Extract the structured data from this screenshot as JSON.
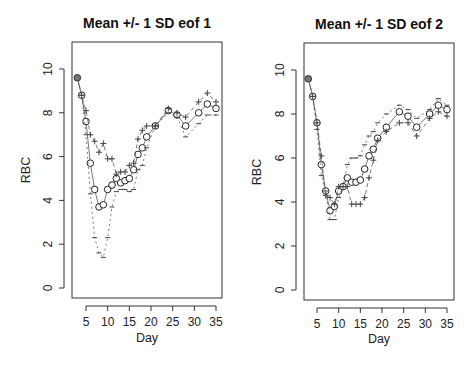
{
  "chart_data": [
    {
      "type": "scatter",
      "title": "Mean +/- 1 SD eof 1",
      "xlabel": "Day",
      "ylabel": "RBC",
      "xlim": [
        2,
        37
      ],
      "ylim": [
        -0.5,
        11
      ],
      "xticks": [
        5,
        10,
        15,
        20,
        25,
        30,
        35
      ],
      "yticks": [
        0,
        2,
        4,
        6,
        8,
        10
      ],
      "grid": false,
      "legend": null,
      "x": [
        3,
        4,
        5,
        6,
        7,
        8,
        9,
        10,
        11,
        12,
        13,
        14,
        15,
        16,
        17,
        18,
        19,
        21,
        24,
        26,
        28,
        31,
        33,
        35
      ],
      "series": [
        {
          "name": "mean",
          "marker": "circle",
          "values": [
            9.6,
            8.8,
            7.6,
            5.7,
            4.5,
            3.7,
            3.8,
            4.5,
            4.7,
            5.0,
            4.8,
            4.9,
            5.0,
            5.4,
            6.1,
            6.4,
            6.9,
            7.4,
            8.1,
            7.9,
            7.4,
            8.0,
            8.4,
            8.2
          ]
        },
        {
          "name": "+1 SD eof",
          "marker": "plus",
          "values": [
            9.6,
            8.8,
            8.1,
            7.0,
            6.7,
            6.2,
            6.6,
            5.9,
            5.9,
            5.2,
            5.3,
            5.3,
            5.6,
            5.7,
            6.8,
            7.2,
            7.4,
            7.4,
            8.2,
            8.0,
            7.8,
            8.5,
            8.9,
            8.5
          ]
        },
        {
          "name": "-1 SD eof",
          "marker": "dash",
          "values": [
            9.6,
            8.8,
            7.0,
            4.3,
            2.3,
            1.6,
            1.4,
            2.3,
            3.7,
            4.4,
            4.5,
            4.5,
            4.4,
            4.5,
            5.4,
            5.6,
            6.4,
            7.4,
            8.0,
            7.8,
            6.9,
            7.5,
            7.9,
            7.9
          ]
        }
      ]
    },
    {
      "type": "scatter",
      "title": "Mean +/- 1 SD eof 2",
      "xlabel": "Day",
      "ylabel": "RBC",
      "xlim": [
        2,
        37
      ],
      "ylim": [
        -0.5,
        11
      ],
      "xticks": [
        5,
        10,
        15,
        20,
        25,
        30,
        35
      ],
      "yticks": [
        0,
        2,
        4,
        6,
        8,
        10
      ],
      "grid": false,
      "legend": null,
      "x": [
        3,
        4,
        5,
        6,
        7,
        8,
        9,
        10,
        11,
        12,
        13,
        14,
        15,
        16,
        17,
        18,
        19,
        21,
        24,
        26,
        28,
        31,
        33,
        35
      ],
      "series": [
        {
          "name": "mean",
          "marker": "circle",
          "values": [
            9.6,
            8.8,
            7.6,
            5.7,
            4.5,
            3.6,
            3.8,
            4.5,
            4.7,
            5.1,
            4.9,
            4.9,
            5.0,
            5.5,
            6.1,
            6.4,
            6.9,
            7.4,
            8.1,
            7.9,
            7.4,
            8.0,
            8.4,
            8.2
          ]
        },
        {
          "name": "+1 SD eof",
          "marker": "plus",
          "values": [
            9.6,
            8.8,
            7.6,
            6.1,
            4.3,
            4.2,
            3.9,
            4.7,
            4.7,
            4.7,
            3.9,
            3.9,
            3.9,
            4.2,
            5.1,
            5.9,
            6.8,
            7.2,
            7.6,
            7.6,
            7.0,
            7.8,
            8.1,
            7.9
          ]
        },
        {
          "name": "-1 SD eof",
          "marker": "dash",
          "values": [
            9.6,
            8.8,
            7.3,
            5.2,
            4.5,
            3.2,
            3.2,
            4.2,
            4.7,
            5.7,
            6.0,
            6.0,
            6.1,
            6.6,
            7.0,
            7.2,
            7.6,
            8.0,
            8.4,
            8.2,
            7.8,
            8.2,
            8.7,
            8.4
          ]
        }
      ]
    }
  ]
}
